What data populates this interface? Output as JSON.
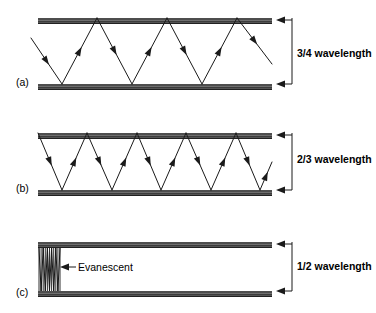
{
  "figure": {
    "background_color": "#ffffff",
    "ink_color": "#1a1a1a",
    "width": 376,
    "height": 313
  },
  "panels": [
    {
      "id": "a",
      "label": "(a)",
      "label_x": 16,
      "label_y": 86,
      "dimension_text": "3/4 wavelength",
      "dimension_label_x": 297,
      "dimension_label_y": 57,
      "wall_left": 38,
      "wall_right": 272,
      "top_wall_y": 18,
      "bottom_wall_y": 84,
      "wall_thickness": 6,
      "bracket_x": 292,
      "bracket_top_y": 18,
      "bracket_bottom_y": 84,
      "ray_mode": "zigzag",
      "ray_segments": 7,
      "ray_start_phase": "mid-left-descending",
      "ray_points": [
        [
          31,
          38
        ],
        [
          62,
          84
        ],
        [
          97,
          18
        ],
        [
          132,
          84
        ],
        [
          167,
          18
        ],
        [
          202,
          84
        ],
        [
          237,
          18
        ],
        [
          272,
          64
        ]
      ],
      "arrow_fraction": 0.5
    },
    {
      "id": "b",
      "label": "(b)",
      "label_x": 16,
      "label_y": 192,
      "dimension_text": "2/3 wavelength",
      "dimension_label_x": 297,
      "dimension_label_y": 163,
      "wall_left": 38,
      "wall_right": 272,
      "top_wall_y": 133,
      "bottom_wall_y": 190,
      "wall_thickness": 6,
      "bracket_x": 292,
      "bracket_top_y": 133,
      "bracket_bottom_y": 190,
      "ray_mode": "zigzag",
      "ray_segments": 10,
      "ray_start_phase": "top-left-descending",
      "ray_points": [
        [
          38,
          133
        ],
        [
          62,
          190
        ],
        [
          87,
          133
        ],
        [
          112,
          190
        ],
        [
          137,
          133
        ],
        [
          161,
          190
        ],
        [
          186,
          133
        ],
        [
          211,
          190
        ],
        [
          236,
          133
        ],
        [
          260,
          190
        ],
        [
          272,
          162
        ]
      ],
      "arrow_fraction": 0.5
    },
    {
      "id": "c",
      "label": "(c)",
      "label_x": 16,
      "label_y": 296,
      "dimension_text": "1/2 wavelength",
      "dimension_label_x": 297,
      "dimension_label_y": 270,
      "wall_left": 38,
      "wall_right": 272,
      "top_wall_y": 242,
      "bottom_wall_y": 291,
      "wall_thickness": 6,
      "bracket_x": 292,
      "bracket_top_y": 242,
      "bracket_bottom_y": 291,
      "ray_mode": "evanescent",
      "evanescent_oscillations": 5,
      "evanescent_left": 39,
      "evanescent_right": 60,
      "annotation": {
        "text": "Evanescent",
        "text_x": 78,
        "text_y": 270,
        "arrow_tail_x": 76,
        "arrow_tip_x": 61,
        "arrow_y": 267
      }
    }
  ],
  "icons": {
    "dimension_arrow": "left-arrow-icon",
    "annotation_arrow": "left-arrow-icon",
    "ray_arrow": "ray-direction-arrow-icon"
  }
}
